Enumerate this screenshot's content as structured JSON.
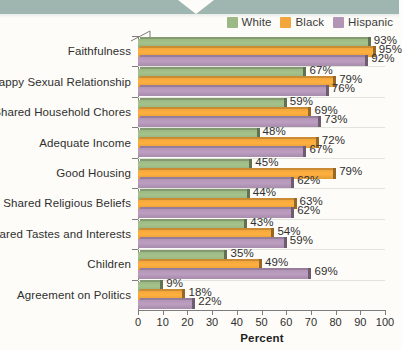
{
  "legend": {
    "items": [
      {
        "label": "White",
        "color": "#9cb884"
      },
      {
        "label": "Black",
        "color": "#f2a63c"
      },
      {
        "label": "Hispanic",
        "color": "#b295b6"
      }
    ]
  },
  "axis": {
    "x_title": "Percent",
    "ticks": [
      "0",
      "10",
      "20",
      "30",
      "40",
      "50",
      "60",
      "70",
      "80",
      "90",
      "100"
    ]
  },
  "chart_data": {
    "type": "bar",
    "orientation": "horizontal",
    "title": "",
    "xlabel": "Percent",
    "ylabel": "",
    "xlim": [
      0,
      100
    ],
    "xticks": [
      0,
      10,
      20,
      30,
      40,
      50,
      60,
      70,
      80,
      90,
      100
    ],
    "grid": false,
    "legend_position": "top-right",
    "value_labels_suffix": "%",
    "categories": [
      "Faithfulness",
      "Happy Sexual Relationship",
      "Shared Household Chores",
      "Adequate Income",
      "Good Housing",
      "Shared Religious Beliefs",
      "Shared Tastes and Interests",
      "Children",
      "Agreement on Politics"
    ],
    "series": [
      {
        "name": "White",
        "color": "#9cb884",
        "values": [
          93,
          67,
          59,
          48,
          45,
          44,
          43,
          35,
          9
        ]
      },
      {
        "name": "Black",
        "color": "#f2a63c",
        "values": [
          95,
          79,
          69,
          72,
          79,
          63,
          54,
          49,
          18
        ]
      },
      {
        "name": "Hispanic",
        "color": "#b295b6",
        "values": [
          92,
          76,
          73,
          67,
          62,
          62,
          59,
          69,
          22
        ]
      }
    ],
    "value_labels": [
      [
        "93%",
        "95%",
        "92%"
      ],
      [
        "67%",
        "79%",
        "76%"
      ],
      [
        "59%",
        "69%",
        "73%"
      ],
      [
        "48%",
        "72%",
        "67%"
      ],
      [
        "45%",
        "79%",
        "62%"
      ],
      [
        "44%",
        "63%",
        "62%"
      ],
      [
        "43%",
        "54%",
        "59%"
      ],
      [
        "35%",
        "49%",
        "69%"
      ],
      [
        "9%",
        "18%",
        "22%"
      ]
    ]
  }
}
